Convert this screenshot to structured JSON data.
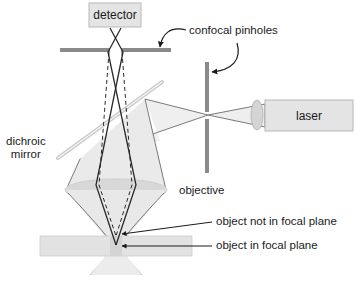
{
  "diagram": {
    "components": {
      "detector": "detector",
      "laser": "laser",
      "dichroic_mirror": "dichroic\nmirror",
      "objective": "objective"
    },
    "annotations": {
      "confocal_pinholes": "confocal pinholes",
      "object_not_in_focal_plane": "object not in focal plane",
      "object_in_focal_plane": "object in focal plane"
    },
    "colors": {
      "box_fill": "#e4e4e4",
      "box_stroke": "#b8b8b8",
      "pinhole": "#8a8a8a",
      "light_cone": "#ececec",
      "beam_line": "#7a7a7a",
      "ray_line": "#2a2a2a",
      "lens_fill": "#d6d6d6",
      "sample_fill": "#e2e2e2",
      "mirror": "#d0d0d0"
    }
  }
}
